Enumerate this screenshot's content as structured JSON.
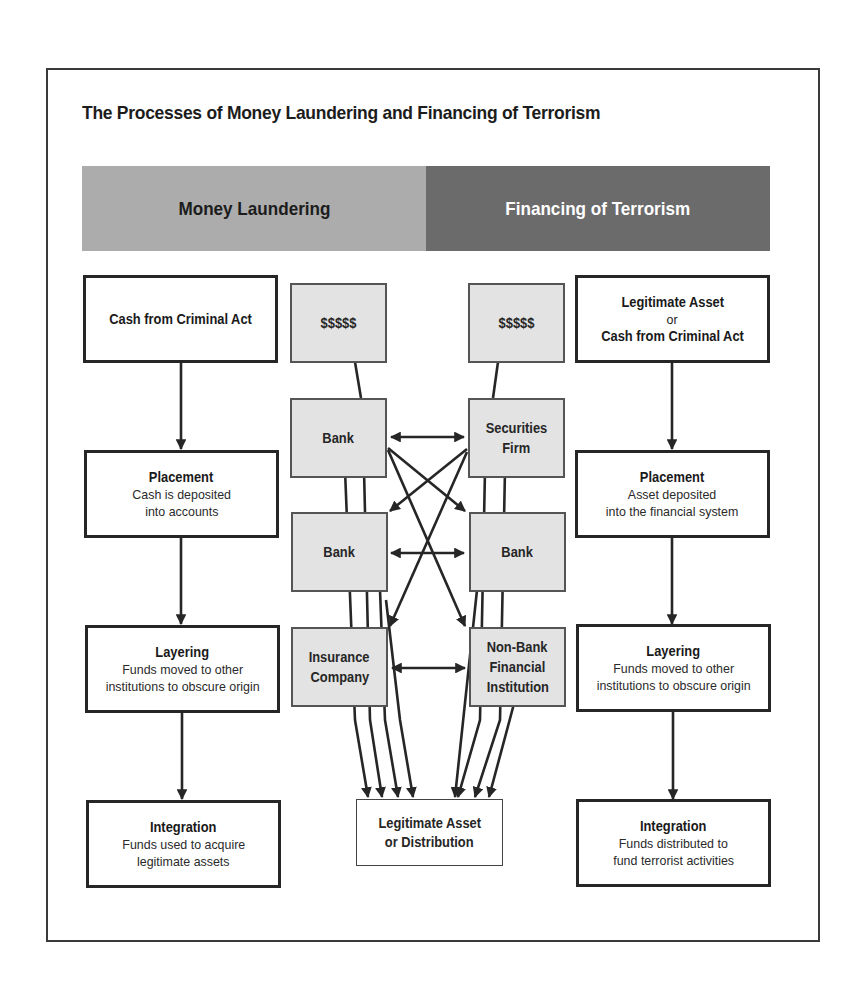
{
  "title": "The Processes of Money Laundering and Financing of Terrorism",
  "header": {
    "left_label": "Money Laundering",
    "right_label": "Financing of Terrorism",
    "colors": {
      "left": "#acacac",
      "right": "#6b6b6b"
    }
  },
  "money_laundering": {
    "source": {
      "title": "Cash from Criminal Act"
    },
    "placement": {
      "title": "Placement",
      "line1": "Cash is deposited",
      "line2": "into accounts"
    },
    "layering": {
      "title": "Layering",
      "line1": "Funds moved to other",
      "line2": "institutions to obscure origin"
    },
    "integration": {
      "title": "Integration",
      "line1": "Funds used to acquire",
      "line2": "legitimate assets"
    }
  },
  "financing_terrorism": {
    "source": {
      "line1": "Legitimate Asset",
      "line2": "or",
      "line3": "Cash from Criminal Act"
    },
    "placement": {
      "title": "Placement",
      "line1": "Asset deposited",
      "line2": "into the financial system"
    },
    "layering": {
      "title": "Layering",
      "line1": "Funds moved to other",
      "line2": "institutions to obscure origin"
    },
    "integration": {
      "title": "Integration",
      "line1": "Funds distributed to",
      "line2": "fund terrorist activities"
    }
  },
  "institutions": {
    "left": [
      {
        "line1": "$$$$$"
      },
      {
        "line1": "Bank"
      },
      {
        "line1": "Bank"
      },
      {
        "line1": "Insurance",
        "line2": "Company"
      }
    ],
    "right": [
      {
        "line1": "$$$$$"
      },
      {
        "line1": "Securities",
        "line2": "Firm"
      },
      {
        "line1": "Bank"
      },
      {
        "line1": "Non-Bank",
        "line2": "Financial",
        "line3": "Institution"
      }
    ]
  },
  "destination": {
    "line1": "Legitimate Asset",
    "line2": "or Distribution"
  }
}
